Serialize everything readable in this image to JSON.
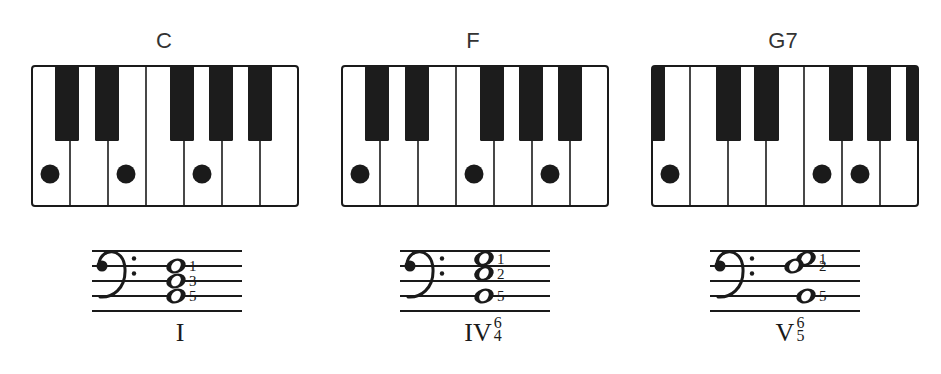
{
  "chords": [
    {
      "name": "C",
      "keyboard": {
        "white_keys": [
          "C",
          "D",
          "E",
          "F",
          "G",
          "A",
          "B"
        ],
        "black_keys_x": [
          [
            23,
            47
          ],
          [
            63,
            87
          ],
          [
            138,
            162
          ],
          [
            177,
            201
          ],
          [
            216,
            240
          ]
        ],
        "pressed_white_indices": [
          0,
          2,
          4
        ]
      },
      "staff": {
        "clef": "bass",
        "notes": [
          {
            "line_pos": 1.0,
            "dx": 0,
            "label": "1"
          },
          {
            "line_pos": 2.0,
            "dx": 0,
            "label": "3"
          },
          {
            "line_pos": 3.0,
            "dx": 0,
            "label": "5"
          }
        ]
      },
      "roman": {
        "numeral": "I",
        "fig_top": "",
        "fig_bottom": ""
      }
    },
    {
      "name": "F",
      "keyboard": {
        "white_keys": [
          "C",
          "D",
          "E",
          "F",
          "G",
          "A",
          "B"
        ],
        "black_keys_x": [
          [
            23,
            47
          ],
          [
            63,
            87
          ],
          [
            138,
            162
          ],
          [
            177,
            201
          ],
          [
            216,
            240
          ]
        ],
        "pressed_white_indices": [
          0,
          3,
          5
        ]
      },
      "staff": {
        "clef": "bass",
        "notes": [
          {
            "line_pos": 0.5,
            "dx": 0,
            "label": "1"
          },
          {
            "line_pos": 1.5,
            "dx": 0,
            "label": "2"
          },
          {
            "line_pos": 3.0,
            "dx": 0,
            "label": "5"
          }
        ]
      },
      "roman": {
        "numeral": "IV",
        "fig_top": "6",
        "fig_bottom": "4"
      }
    },
    {
      "name": "G7",
      "keyboard": {
        "white_keys": [
          "B",
          "C",
          "D",
          "E",
          "F",
          "G",
          "A"
        ],
        "black_keys_x": [
          [
            0,
            13
          ],
          [
            64,
            89
          ],
          [
            102,
            127
          ],
          [
            177,
            201
          ],
          [
            215,
            239
          ],
          [
            254,
            266
          ]
        ],
        "pressed_white_indices": [
          0,
          4,
          5
        ]
      },
      "staff": {
        "clef": "bass",
        "notes": [
          {
            "line_pos": 0.5,
            "dx": 12,
            "label": "1"
          },
          {
            "line_pos": 1.0,
            "dx": 0,
            "label": "2"
          },
          {
            "line_pos": 3.0,
            "dx": 12,
            "label": "5"
          }
        ]
      },
      "roman": {
        "numeral": "V",
        "fig_top": "6",
        "fig_bottom": "5"
      }
    }
  ],
  "colors": {
    "ink": "#1a1a1a",
    "white_key": "#ffffff",
    "black_key": "#1c1c1c"
  }
}
